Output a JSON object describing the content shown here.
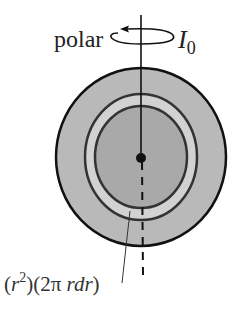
{
  "figure": {
    "labels": {
      "axis_label": "polar",
      "moment_symbol": "I",
      "moment_subscript": "0",
      "formula_open": "(",
      "formula_r": "r",
      "formula_exp": "2",
      "formula_mid": ")(2π ",
      "formula_rdr": "rdr",
      "formula_close": ")"
    },
    "colors": {
      "outer_disk": "#b9b9b9",
      "ring_band": "#d2d2d2",
      "inner_core": "#a9a9a9",
      "outline": "#111111"
    }
  }
}
